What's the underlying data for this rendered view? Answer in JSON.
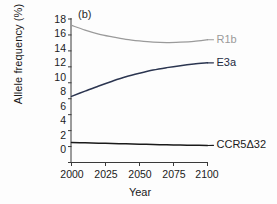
{
  "figure": {
    "panel_label": "(b)",
    "xlabel": "Year",
    "ylabel": "Allele frequency (%)"
  },
  "chart_data": {
    "type": "line",
    "title": "",
    "panel": "(b)",
    "xlabel": "Year",
    "ylabel": "Allele frequency (%)",
    "xlim": [
      2000,
      2100
    ],
    "ylim": [
      0,
      18
    ],
    "xticks": [
      2000,
      2025,
      2050,
      2075,
      2100
    ],
    "yticks": [
      0,
      2,
      4,
      6,
      8,
      10,
      12,
      14,
      16,
      18
    ],
    "grid": false,
    "legend_position": "right-inline-labels",
    "x": [
      2000,
      2010,
      2020,
      2030,
      2040,
      2050,
      2060,
      2070,
      2080,
      2090,
      2100
    ],
    "series": [
      {
        "name": "R1b",
        "color": "#9a9a9a",
        "label_color": "#9a9a9a",
        "label_y": 15.4,
        "values": [
          17.2,
          16.6,
          16.1,
          15.75,
          15.45,
          15.25,
          15.1,
          15.05,
          15.1,
          15.2,
          15.4
        ]
      },
      {
        "name": "E3a",
        "color": "#2b3550",
        "label_color": "#232a3d",
        "label_y": 12.5,
        "values": [
          8.3,
          8.95,
          9.6,
          10.2,
          10.75,
          11.2,
          11.6,
          11.9,
          12.15,
          12.35,
          12.5
        ]
      },
      {
        "name": "CCR5Δ32",
        "color": "#1a1a1a",
        "label_color": "#1a1a1a",
        "label_y": 2.15,
        "values": [
          2.52,
          2.47,
          2.42,
          2.38,
          2.34,
          2.3,
          2.26,
          2.22,
          2.19,
          2.16,
          2.13
        ]
      }
    ]
  },
  "ytick_labels": [
    "18",
    "16",
    "14",
    "12",
    "10",
    "8",
    "6",
    "4",
    "2",
    "0"
  ],
  "xtick_labels": [
    "2000",
    "2025",
    "2050",
    "2075",
    "2100"
  ],
  "series_labels": {
    "r1b": "R1b",
    "e3a": "E3a",
    "ccr5": "CCR5Δ32"
  }
}
